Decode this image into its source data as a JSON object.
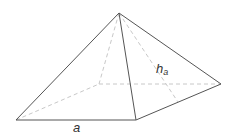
{
  "figure": {
    "type": "square pyramid",
    "labels": {
      "base_edge": "a",
      "slant_height_main": "h",
      "slant_height_sub": "a"
    },
    "colors": {
      "edge": "#555555",
      "hidden_edge": "#c8c8c8",
      "text": "#333333"
    },
    "vertices": {
      "apex": [
        119,
        13
      ],
      "front_left": [
        16,
        120
      ],
      "front_right": [
        136,
        120
      ],
      "back_right": [
        221,
        84
      ],
      "back_left": [
        99,
        84
      ],
      "slant_foot": [
        178,
        102
      ]
    }
  }
}
